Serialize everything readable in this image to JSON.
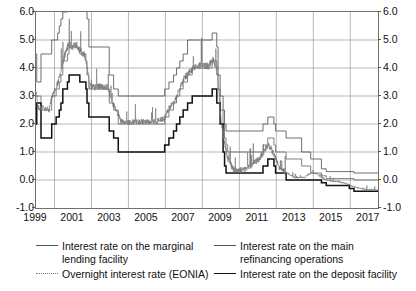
{
  "chart_data": {
    "type": "line",
    "title": "",
    "xlabel": "",
    "ylabel": "",
    "xlim": [
      1999,
      2017.5
    ],
    "ylim": [
      -1.0,
      6.0
    ],
    "grid": true,
    "legend_position": "bottom",
    "y_ticks": [
      "6.0",
      "5.0",
      "4.0",
      "3.0",
      "2.0",
      "1.0",
      "0.0",
      "-1.0"
    ],
    "y_tick_values": [
      6.0,
      5.0,
      4.0,
      3.0,
      2.0,
      1.0,
      0.0,
      -1.0
    ],
    "x_ticks": [
      "1999",
      "2001",
      "2003",
      "2005",
      "2007",
      "2009",
      "2011",
      "2013",
      "2015",
      "2017"
    ],
    "x_tick_values": [
      1999,
      2001,
      2003,
      2005,
      2007,
      2009,
      2011,
      2013,
      2015,
      2017
    ],
    "series": [
      {
        "name": "Interest rate on the marginal lending facility",
        "style": "step",
        "line": "solid-thin",
        "color": "#555555",
        "points": [
          [
            1999.0,
            4.5
          ],
          [
            1999.03,
            4.5
          ],
          [
            1999.04,
            3.5
          ],
          [
            1999.26,
            3.5
          ],
          [
            1999.27,
            4.5
          ],
          [
            1999.84,
            4.5
          ],
          [
            1999.85,
            5.0
          ],
          [
            2000.09,
            5.0
          ],
          [
            2000.17,
            5.25
          ],
          [
            2000.26,
            5.5
          ],
          [
            2000.35,
            5.75
          ],
          [
            2000.45,
            6.0
          ],
          [
            2000.7,
            6.25
          ],
          [
            2000.79,
            6.75
          ],
          [
            2001.36,
            6.75
          ],
          [
            2001.37,
            6.5
          ],
          [
            2001.7,
            6.25
          ],
          [
            2001.76,
            5.75
          ],
          [
            2001.86,
            4.75
          ],
          [
            2002.95,
            4.75
          ],
          [
            2002.96,
            3.75
          ],
          [
            2003.2,
            3.25
          ],
          [
            2003.45,
            3.0
          ],
          [
            2005.95,
            3.0
          ],
          [
            2005.96,
            3.25
          ],
          [
            2006.19,
            3.5
          ],
          [
            2006.44,
            3.75
          ],
          [
            2006.6,
            4.0
          ],
          [
            2006.78,
            4.25
          ],
          [
            2006.96,
            4.5
          ],
          [
            2007.2,
            5.0
          ],
          [
            2007.45,
            5.0
          ],
          [
            2008.53,
            5.25
          ],
          [
            2008.78,
            4.75
          ],
          [
            2008.85,
            3.75
          ],
          [
            2008.96,
            3.0
          ],
          [
            2009.12,
            2.5
          ],
          [
            2009.2,
            2.0
          ],
          [
            2009.28,
            1.75
          ],
          [
            2009.37,
            1.75
          ],
          [
            2011.28,
            2.0
          ],
          [
            2011.54,
            2.25
          ],
          [
            2011.87,
            2.0
          ],
          [
            2011.96,
            1.75
          ],
          [
            2012.53,
            1.5
          ],
          [
            2013.37,
            1.0
          ],
          [
            2013.86,
            0.75
          ],
          [
            2014.44,
            0.4
          ],
          [
            2014.7,
            0.3
          ],
          [
            2016.2,
            0.25
          ],
          [
            2017.5,
            0.25
          ]
        ]
      },
      {
        "name": "Interest rate on the main refinancing operations",
        "style": "step",
        "line": "solid-thin",
        "color": "#6a6a6a",
        "points": [
          [
            1999.0,
            3.0
          ],
          [
            1999.26,
            3.0
          ],
          [
            1999.27,
            2.5
          ],
          [
            1999.84,
            2.5
          ],
          [
            1999.85,
            3.0
          ],
          [
            2000.09,
            3.25
          ],
          [
            2000.26,
            3.5
          ],
          [
            2000.35,
            3.75
          ],
          [
            2000.45,
            4.25
          ],
          [
            2000.7,
            4.5
          ],
          [
            2000.79,
            4.75
          ],
          [
            2001.36,
            4.75
          ],
          [
            2001.37,
            4.5
          ],
          [
            2001.7,
            4.25
          ],
          [
            2001.76,
            3.75
          ],
          [
            2001.86,
            3.25
          ],
          [
            2002.95,
            3.25
          ],
          [
            2002.96,
            2.75
          ],
          [
            2003.2,
            2.5
          ],
          [
            2003.45,
            2.0
          ],
          [
            2005.95,
            2.0
          ],
          [
            2005.96,
            2.25
          ],
          [
            2006.19,
            2.5
          ],
          [
            2006.44,
            2.75
          ],
          [
            2006.6,
            3.0
          ],
          [
            2006.78,
            3.25
          ],
          [
            2006.96,
            3.5
          ],
          [
            2007.2,
            3.75
          ],
          [
            2007.45,
            4.0
          ],
          [
            2008.53,
            4.25
          ],
          [
            2008.78,
            3.75
          ],
          [
            2008.85,
            3.25
          ],
          [
            2008.96,
            2.5
          ],
          [
            2009.12,
            2.0
          ],
          [
            2009.2,
            1.5
          ],
          [
            2009.28,
            1.25
          ],
          [
            2009.37,
            1.0
          ],
          [
            2011.28,
            1.25
          ],
          [
            2011.54,
            1.5
          ],
          [
            2011.87,
            1.25
          ],
          [
            2011.96,
            1.0
          ],
          [
            2012.53,
            0.75
          ],
          [
            2013.37,
            0.5
          ],
          [
            2013.86,
            0.25
          ],
          [
            2014.44,
            0.15
          ],
          [
            2014.7,
            0.05
          ],
          [
            2016.2,
            0.0
          ],
          [
            2017.5,
            0.0
          ]
        ]
      },
      {
        "name": "Interest rate on the deposit facility",
        "style": "step",
        "line": "solid-thick",
        "color": "#111111",
        "points": [
          [
            1999.0,
            2.0
          ],
          [
            1999.03,
            2.0
          ],
          [
            1999.04,
            2.75
          ],
          [
            1999.26,
            2.75
          ],
          [
            1999.27,
            1.5
          ],
          [
            1999.84,
            1.5
          ],
          [
            1999.85,
            2.0
          ],
          [
            2000.09,
            2.25
          ],
          [
            2000.26,
            2.5
          ],
          [
            2000.35,
            2.75
          ],
          [
            2000.45,
            3.25
          ],
          [
            2000.7,
            3.5
          ],
          [
            2000.79,
            3.75
          ],
          [
            2001.36,
            3.75
          ],
          [
            2001.37,
            3.5
          ],
          [
            2001.7,
            3.25
          ],
          [
            2001.76,
            2.75
          ],
          [
            2001.86,
            2.25
          ],
          [
            2002.95,
            2.25
          ],
          [
            2002.96,
            1.75
          ],
          [
            2003.2,
            1.5
          ],
          [
            2003.45,
            1.0
          ],
          [
            2005.95,
            1.0
          ],
          [
            2005.96,
            1.25
          ],
          [
            2006.19,
            1.5
          ],
          [
            2006.44,
            1.75
          ],
          [
            2006.6,
            2.0
          ],
          [
            2006.78,
            2.25
          ],
          [
            2006.96,
            2.5
          ],
          [
            2007.2,
            2.75
          ],
          [
            2007.45,
            3.0
          ],
          [
            2008.53,
            3.25
          ],
          [
            2008.78,
            2.75
          ],
          [
            2008.85,
            2.75
          ],
          [
            2008.96,
            2.0
          ],
          [
            2009.12,
            1.0
          ],
          [
            2009.2,
            0.5
          ],
          [
            2009.28,
            0.25
          ],
          [
            2009.37,
            0.25
          ],
          [
            2011.28,
            0.5
          ],
          [
            2011.54,
            0.75
          ],
          [
            2011.87,
            0.5
          ],
          [
            2011.96,
            0.25
          ],
          [
            2012.53,
            0.0
          ],
          [
            2013.37,
            0.0
          ],
          [
            2014.44,
            -0.1
          ],
          [
            2014.7,
            -0.2
          ],
          [
            2015.95,
            -0.3
          ],
          [
            2016.2,
            -0.4
          ],
          [
            2017.5,
            -0.4
          ]
        ]
      },
      {
        "name": "Overnight interest rate (EONIA)",
        "style": "noisy",
        "line": "dotted",
        "color": "#777777",
        "description": "Daily overnight rate fluctuating between the deposit and marginal lending corridor, tracking the main refinancing rate closely.",
        "anchors": [
          [
            1999.0,
            3.1
          ],
          [
            1999.12,
            2.6
          ],
          [
            1999.25,
            2.55
          ],
          [
            1999.4,
            2.55
          ],
          [
            1999.7,
            2.5
          ],
          [
            1999.9,
            3.05
          ],
          [
            2000.1,
            3.3
          ],
          [
            2000.3,
            3.7
          ],
          [
            2000.5,
            4.3
          ],
          [
            2000.75,
            4.8
          ],
          [
            2001.0,
            4.78
          ],
          [
            2001.2,
            4.8
          ],
          [
            2001.4,
            4.6
          ],
          [
            2001.7,
            4.35
          ],
          [
            2001.9,
            3.35
          ],
          [
            2002.2,
            3.3
          ],
          [
            2002.5,
            3.32
          ],
          [
            2002.9,
            3.3
          ],
          [
            2003.1,
            2.75
          ],
          [
            2003.35,
            2.5
          ],
          [
            2003.6,
            2.08
          ],
          [
            2004.0,
            2.05
          ],
          [
            2004.5,
            2.07
          ],
          [
            2005.0,
            2.08
          ],
          [
            2005.5,
            2.08
          ],
          [
            2005.95,
            2.2
          ],
          [
            2006.2,
            2.55
          ],
          [
            2006.5,
            2.8
          ],
          [
            2006.8,
            3.3
          ],
          [
            2007.0,
            3.6
          ],
          [
            2007.3,
            3.85
          ],
          [
            2007.6,
            4.05
          ],
          [
            2008.0,
            4.1
          ],
          [
            2008.3,
            4.05
          ],
          [
            2008.6,
            4.3
          ],
          [
            2008.8,
            3.9
          ],
          [
            2009.0,
            2.2
          ],
          [
            2009.2,
            1.3
          ],
          [
            2009.4,
            0.7
          ],
          [
            2009.7,
            0.35
          ],
          [
            2010.0,
            0.34
          ],
          [
            2010.4,
            0.4
          ],
          [
            2010.8,
            0.6
          ],
          [
            2011.1,
            0.75
          ],
          [
            2011.4,
            1.1
          ],
          [
            2011.6,
            1.25
          ],
          [
            2011.9,
            0.85
          ],
          [
            2012.2,
            0.37
          ],
          [
            2012.6,
            0.25
          ],
          [
            2013.0,
            0.08
          ],
          [
            2013.5,
            0.09
          ],
          [
            2013.9,
            0.25
          ],
          [
            2014.2,
            0.22
          ],
          [
            2014.5,
            0.05
          ],
          [
            2014.8,
            -0.02
          ],
          [
            2015.3,
            -0.06
          ],
          [
            2015.8,
            -0.13
          ],
          [
            2016.2,
            -0.25
          ],
          [
            2016.8,
            -0.34
          ],
          [
            2017.4,
            -0.35
          ]
        ]
      }
    ]
  },
  "legend": {
    "items": [
      {
        "label": "Interest rate on the marginal lending facility",
        "key": "solid-thin"
      },
      {
        "label": "Interest rate on the main refinancing operations",
        "key": "solid-thin"
      },
      {
        "label": "Overnight interest rate (EONIA)",
        "key": "dotted"
      },
      {
        "label": "Interest rate on the deposit facility",
        "key": "solid-thick"
      }
    ]
  }
}
